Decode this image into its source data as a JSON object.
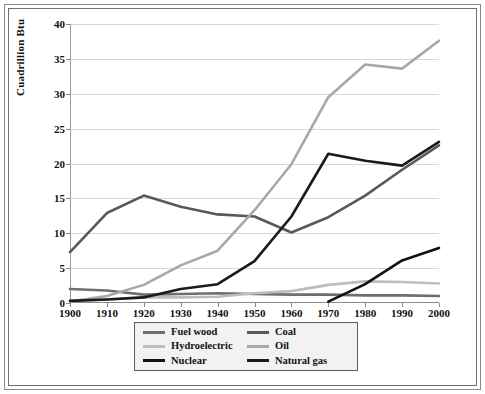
{
  "chart_data": {
    "type": "line",
    "title": "",
    "xlabel": "",
    "ylabel": "Cuadrillion Btu",
    "x": [
      1900,
      1910,
      1920,
      1930,
      1940,
      1950,
      1960,
      1970,
      1980,
      1990,
      2000
    ],
    "xlim": [
      1900,
      2000
    ],
    "ylim": [
      0,
      40
    ],
    "yticks": [
      0,
      5,
      10,
      15,
      20,
      25,
      30,
      35,
      40
    ],
    "xticks": [
      1900,
      1910,
      1920,
      1930,
      1940,
      1950,
      1960,
      1970,
      1980,
      1990,
      2000
    ],
    "grid": true,
    "legend_position": "bottom-center",
    "series": [
      {
        "name": "Fuel wood",
        "color": "#6e6e6e",
        "values": [
          2.0,
          1.8,
          1.2,
          1.3,
          1.4,
          1.3,
          1.2,
          1.2,
          1.1,
          1.1,
          1.0
        ]
      },
      {
        "name": "Coal",
        "color": "#595959",
        "values": [
          7.3,
          12.9,
          15.4,
          13.8,
          12.7,
          12.4,
          10.1,
          12.3,
          15.4,
          19.1,
          22.6
        ]
      },
      {
        "name": "Hydroelectric",
        "color": "#bdbdbd",
        "values": [
          0.3,
          0.5,
          0.8,
          0.8,
          0.9,
          1.4,
          1.7,
          2.6,
          3.1,
          3.0,
          2.8
        ]
      },
      {
        "name": "Oil",
        "color": "#a8a8a8",
        "values": [
          0.2,
          1.0,
          2.6,
          5.4,
          7.5,
          13.3,
          19.9,
          29.5,
          34.2,
          33.6,
          37.6
        ]
      },
      {
        "name": "Nuclear",
        "color": "#111111",
        "values": [
          0,
          0,
          0,
          0,
          0,
          0,
          0,
          0.2,
          2.7,
          6.1,
          7.9
        ]
      },
      {
        "name": "Natural gas",
        "color": "#1a1a1a",
        "values": [
          0.3,
          0.5,
          0.8,
          2.0,
          2.7,
          6.0,
          12.4,
          21.4,
          20.4,
          19.7,
          23.1
        ]
      }
    ]
  },
  "axis": {
    "ytick_labels": [
      "0",
      "5",
      "10",
      "15",
      "20",
      "25",
      "30",
      "35",
      "40"
    ],
    "xtick_labels": [
      "1900",
      "1910",
      "1920",
      "1930",
      "1940",
      "1950",
      "1960",
      "1970",
      "1980",
      "1990",
      "2000"
    ]
  },
  "legend": {
    "items": [
      {
        "label": "Fuel wood",
        "color": "#6e6e6e"
      },
      {
        "label": "Coal",
        "color": "#595959"
      },
      {
        "label": "Hydroelectric",
        "color": "#bdbdbd"
      },
      {
        "label": "Oil",
        "color": "#a8a8a8"
      },
      {
        "label": "Nuclear",
        "color": "#111111"
      },
      {
        "label": "Natural gas",
        "color": "#1a1a1a"
      }
    ]
  }
}
